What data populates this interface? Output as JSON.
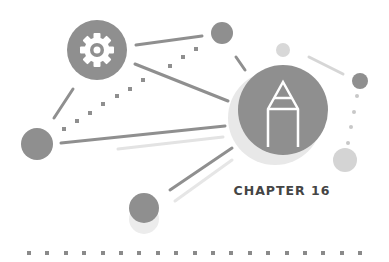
{
  "chapter": {
    "label": "CHAPTER 16"
  },
  "icons": {
    "gear": "gear-icon",
    "pencil": "pencil-icon"
  },
  "colors": {
    "node": "#8f8f8f",
    "node_light": "#d4d4d4",
    "halo": "#e8e8e8",
    "line": "#8f8f8f",
    "line_light": "#e3e3e3",
    "text": "#454545",
    "dots": "#8a8a8a"
  }
}
